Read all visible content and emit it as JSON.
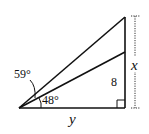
{
  "diagram": {
    "type": "geometry-right-triangle",
    "labels": {
      "angle_outer": "59°",
      "angle_inner": "48°",
      "side_vertical_inner": "8",
      "side_vertical_total": "x",
      "side_base": "y"
    },
    "colors": {
      "stroke": "#111111",
      "background": "#ffffff"
    }
  }
}
